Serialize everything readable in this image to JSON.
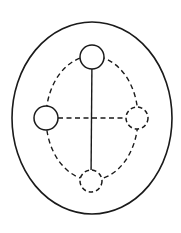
{
  "diagram": {
    "background": "#ffffff",
    "stroke_color": "#1a1a1a",
    "outer_ellipse": {
      "cx": 92,
      "cy": 118,
      "rx": 80,
      "ry": 96,
      "style": "solid"
    },
    "inner_ellipse": {
      "cx": 92,
      "cy": 118,
      "rx": 46,
      "ry": 62,
      "style": "dashed"
    },
    "nodes": [
      {
        "id": "top",
        "cx": 92,
        "cy": 57,
        "r": 12,
        "style": "solid"
      },
      {
        "id": "left",
        "cx": 46,
        "cy": 118,
        "r": 12,
        "style": "solid"
      },
      {
        "id": "right",
        "cx": 137,
        "cy": 118,
        "r": 11,
        "style": "dashed"
      },
      {
        "id": "bottom",
        "cx": 91,
        "cy": 181,
        "r": 11,
        "style": "dashed"
      }
    ],
    "edges": [
      {
        "from": "top",
        "to": "bottom",
        "style": "solid"
      },
      {
        "from": "left",
        "to": "right",
        "style": "dashed"
      }
    ]
  }
}
